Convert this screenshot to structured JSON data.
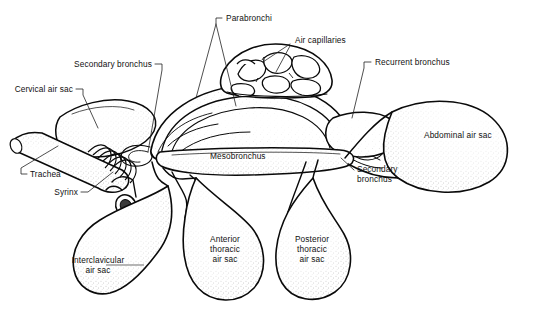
{
  "figure": {
    "background_color": "#ffffff",
    "ink_color": "#0a0a0a",
    "width": 533,
    "height": 323
  },
  "labels": {
    "parabronchi": "Parabronchi",
    "air_capillaries": "Air capillaries",
    "secondary_bronchus_top": "Secondary bronchus",
    "cervical_air_sac": "Cervical air sac",
    "recurrent_bronchus": "Recurrent bronchus",
    "abdominal_air_sac": "Abdominal air sac",
    "mesobronchus": "Mesobronchus",
    "trachea": "Trachea",
    "syrinx": "Syrinx",
    "secondary_bronchus_lower_line1": "Secondary",
    "secondary_bronchus_lower_line2": "bronchus",
    "interclavicular_line1": "Interclavicular",
    "interclavicular_line2": "air sac",
    "anterior_thoracic_line1": "Anterior",
    "anterior_thoracic_line2": "thoracic",
    "anterior_thoracic_line3": "air sac",
    "posterior_thoracic_line1": "Posterior",
    "posterior_thoracic_line2": "thoracic",
    "posterior_thoracic_line3": "air sac"
  }
}
